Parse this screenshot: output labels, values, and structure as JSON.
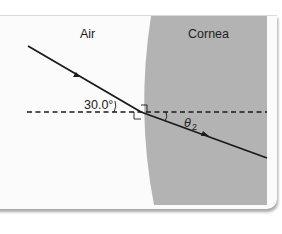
{
  "diagram": {
    "regions": {
      "left_medium": "Air",
      "right_medium": "Cornea"
    },
    "angles": {
      "incident": "30.0°",
      "refracted_symbol": "θ",
      "refracted_subscript": "2"
    },
    "colors": {
      "cornea_fill": "#b3b3b3",
      "card_bg": "#fbfbfb",
      "ray": "#1a1a1a",
      "normal_line": "#1a1a1a"
    }
  }
}
